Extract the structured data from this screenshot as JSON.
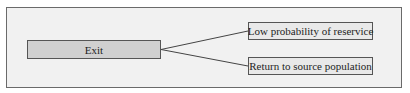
{
  "diagram": {
    "type": "tree",
    "source": {
      "label": "Exit"
    },
    "targets": [
      {
        "label": "Low probability of reservice"
      },
      {
        "label": "Return to source population"
      }
    ],
    "colors": {
      "frame_bg": "#f1f1f1",
      "source_fill": "#d0d0d0",
      "target_fill": "#e9e9e9",
      "stroke": "#555555"
    }
  }
}
